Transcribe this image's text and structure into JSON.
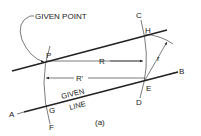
{
  "figure": {
    "caption": "(a)",
    "labels": {
      "given_point": "GIVEN POINT",
      "given_line_1": "GIVEN",
      "given_line_2": "LINE",
      "P": "P",
      "R": "R",
      "R_prime": "R'",
      "r": "r",
      "A": "A",
      "B": "B",
      "C": "C",
      "D": "D",
      "E": "E",
      "F": "F",
      "G": "G",
      "H": "H"
    },
    "colors": {
      "line": "#222222",
      "background": "#ffffff"
    }
  }
}
